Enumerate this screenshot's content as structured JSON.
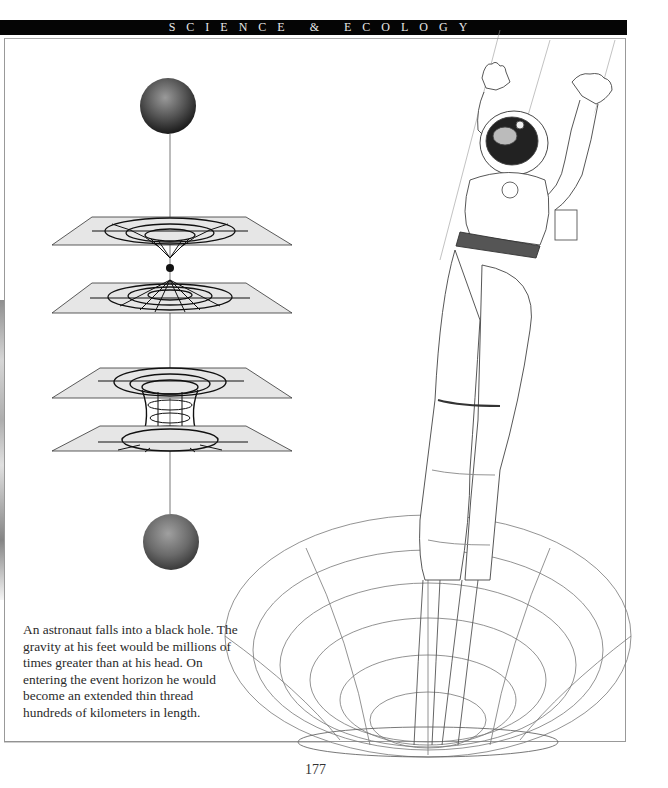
{
  "header": {
    "section_title": "SCIENCE & ECOLOGY"
  },
  "figure": {
    "diagram": {
      "description": "Wormhole / black hole spacetime diagrams",
      "top_sphere": "sphere",
      "bottom_sphere": "sphere",
      "planes": [
        "black-hole-funnel-plane",
        "white-hole-plane",
        "wormhole-top-plane",
        "wormhole-bottom-plane"
      ]
    },
    "illustration": "astronaut-falling-into-black-hole"
  },
  "caption": {
    "text": "An astronaut falls into a black hole. The gravity at his feet would be millions of times greater than at his head. On entering the event horizon he would become an extended thin thread hundreds of kilometers in length."
  },
  "footer": {
    "page_number": "177"
  },
  "colors": {
    "header_bg": "#050505",
    "header_text": "#e8e8e8",
    "plane_fill": "#e6e6e6",
    "grid_line": "#111111"
  }
}
